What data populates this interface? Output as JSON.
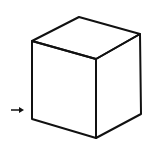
{
  "diagram": {
    "type": "isometric-cube-line-drawing",
    "stroke_color": "#111111",
    "background": "#ffffff",
    "arrow": {
      "direction": "right",
      "points_to": "left-front-edge"
    }
  }
}
